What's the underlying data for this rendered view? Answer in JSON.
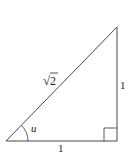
{
  "diagram": {
    "type": "right-triangle",
    "vertices": {
      "angle_vertex": [
        6,
        141
      ],
      "right_angle_vertex": [
        117,
        141
      ],
      "top_vertex": [
        117,
        27
      ]
    },
    "labels": {
      "hypotenuse": "2",
      "hypotenuse_prefix": "√",
      "vertical_side": "1",
      "horizontal_side": "1",
      "angle": "u"
    },
    "colors": {
      "stroke": "#333333",
      "text": "#222222",
      "background": "#ffffff"
    }
  }
}
